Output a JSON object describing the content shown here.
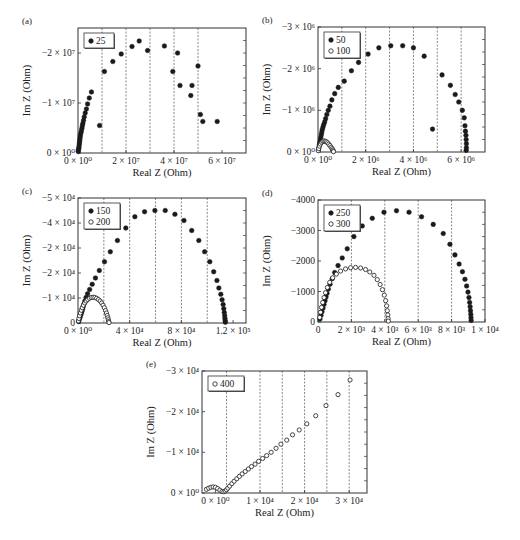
{
  "figure": {
    "background": "#ffffff",
    "marker_color": "#1a1a1a",
    "grid_color": "#555555"
  },
  "chart_data": [
    {
      "id": "a",
      "type": "scatter",
      "panel_label": "(a)",
      "xlabel": "Real Z (Ohm)",
      "ylabel": "Im Z (Ohm)",
      "xlim": [
        0,
        70000000
      ],
      "ylim": [
        0,
        -25000000
      ],
      "xticks": [
        {
          "v": 0,
          "label": "0 × 10⁰"
        },
        {
          "v": 20000000,
          "label": "2 × 10⁷"
        },
        {
          "v": 40000000,
          "label": "4 × 10⁷"
        },
        {
          "v": 60000000,
          "label": "6 × 10⁷"
        }
      ],
      "yticks": [
        {
          "v": 0,
          "label": "0 × 10⁰"
        },
        {
          "v": -10000000,
          "label": "−1 × 10⁷"
        },
        {
          "v": -20000000,
          "label": "−2 × 10⁷"
        }
      ],
      "vgrid": [
        10000000,
        20000000,
        30000000,
        40000000,
        50000000
      ],
      "legend": [
        {
          "label": "25",
          "marker": "filled"
        }
      ],
      "series": [
        {
          "name": "25",
          "marker": "filled",
          "x": [
            100000,
            200000,
            300000,
            400000,
            500000,
            600000,
            700000,
            800000,
            900000,
            1000000,
            1200000,
            1400000,
            1600000,
            1800000,
            2000000,
            2300000,
            2600000,
            3000000,
            3500000,
            4000000,
            4700000,
            5600000,
            9000000,
            11000000,
            14500000,
            18000000,
            22500000,
            25500000,
            29000000,
            36000000,
            39500000,
            41500000,
            42500000,
            47000000,
            47500000,
            50000000,
            51000000,
            52000000,
            58000000
          ],
          "y": [
            -300000,
            -600000,
            -900000,
            -1200000,
            -1600000,
            -2000000,
            -2400000,
            -2800000,
            -3200000,
            -3600000,
            -4000000,
            -4400000,
            -4900000,
            -5400000,
            -5900000,
            -6500000,
            -7200000,
            -8000000,
            -8800000,
            -9800000,
            -11000000,
            -12200000,
            -5500000,
            -16300000,
            -18300000,
            -19800000,
            -21300000,
            -22400000,
            -20500000,
            -21400000,
            -16300000,
            -20000000,
            -13500000,
            -11500000,
            -13500000,
            -17400000,
            -7700000,
            -6300000,
            -6300000
          ]
        }
      ]
    },
    {
      "id": "b",
      "type": "scatter",
      "panel_label": "(b)",
      "xlabel": "Real Z (Ohm)",
      "ylabel": "Im Z (Ohm)",
      "xlim": [
        0,
        7000000
      ],
      "ylim": [
        0,
        -3000000
      ],
      "xticks": [
        {
          "v": 0,
          "label": "0 × 10⁰"
        },
        {
          "v": 2000000,
          "label": "2 × 10⁶"
        },
        {
          "v": 4000000,
          "label": "4 × 10⁶"
        },
        {
          "v": 6000000,
          "label": "6 × 10⁶"
        }
      ],
      "yticks": [
        {
          "v": 0,
          "label": "0 × 10⁰"
        },
        {
          "v": -1000000,
          "label": "−1 × 10⁶"
        },
        {
          "v": -2000000,
          "label": "−2 × 10⁶"
        },
        {
          "v": -3000000,
          "label": "−3 × 10⁶"
        }
      ],
      "vgrid": [
        1000000,
        2000000,
        3000000,
        4000000,
        5000000,
        6000000
      ],
      "legend": [
        {
          "label": "50",
          "marker": "filled"
        },
        {
          "label": "100",
          "marker": "open"
        }
      ],
      "series": [
        {
          "name": "50",
          "marker": "filled",
          "x": [
            20000,
            40000,
            60000,
            80000,
            100000,
            120000,
            140000,
            160000,
            180000,
            210000,
            240000,
            280000,
            320000,
            370000,
            430000,
            500000,
            580000,
            700000,
            850000,
            1100000,
            1400000,
            1700000,
            2100000,
            2550000,
            3050000,
            3550000,
            4000000,
            4450000,
            4800000,
            5200000,
            5550000,
            5750000,
            5900000,
            6050000,
            6130000,
            6160000,
            6180000,
            6200000,
            6210000,
            6220000,
            6220000,
            6210000
          ],
          "y": [
            -60000,
            -120000,
            -180000,
            -240000,
            -300000,
            -360000,
            -420000,
            -480000,
            -540000,
            -600000,
            -660000,
            -720000,
            -800000,
            -900000,
            -1000000,
            -1100000,
            -1250000,
            -1400000,
            -1550000,
            -1700000,
            -1950000,
            -2150000,
            -2350000,
            -2500000,
            -2550000,
            -2550000,
            -2500000,
            -2300000,
            -550000,
            -1850000,
            -1600000,
            -1380000,
            -1200000,
            -1000000,
            -820000,
            -630000,
            -500000,
            -400000,
            -300000,
            -200000,
            -100000,
            -40000
          ]
        },
        {
          "name": "100",
          "marker": "open",
          "x": [
            10000,
            30000,
            60000,
            100000,
            150000,
            200000,
            250000,
            300000,
            350000,
            400000,
            450000,
            500000,
            550000,
            590000,
            620000,
            640000,
            650000
          ],
          "y": [
            -30000,
            -80000,
            -140000,
            -190000,
            -230000,
            -255000,
            -265000,
            -260000,
            -245000,
            -220000,
            -190000,
            -155000,
            -115000,
            -80000,
            -50000,
            -25000,
            -8000
          ]
        }
      ]
    },
    {
      "id": "c",
      "type": "scatter",
      "panel_label": "(c)",
      "xlabel": "Real Z (Ohm)",
      "ylabel": "Im Z (Ohm)",
      "xlim": [
        0,
        130000
      ],
      "ylim": [
        0,
        -50000
      ],
      "xticks": [
        {
          "v": 0,
          "label": "0 × 10⁰"
        },
        {
          "v": 40000,
          "label": "4 × 10⁴"
        },
        {
          "v": 80000,
          "label": "8 × 10⁴"
        },
        {
          "v": 120000,
          "label": "1.2 × 10⁵"
        }
      ],
      "yticks": [
        {
          "v": 0,
          "label": "0"
        },
        {
          "v": -10000,
          "label": "−1 × 10⁴"
        },
        {
          "v": -20000,
          "label": "−2 × 10⁴"
        },
        {
          "v": -30000,
          "label": "−2 × 10⁴"
        },
        {
          "v": -40000,
          "label": "−4 × 10⁴"
        },
        {
          "v": -50000,
          "label": "−5 × 10⁴"
        }
      ],
      "vgrid": [
        20000,
        40000,
        60000,
        80000,
        100000
      ],
      "legend": [
        {
          "label": "150",
          "marker": "filled"
        },
        {
          "label": "200",
          "marker": "open"
        }
      ],
      "series": [
        {
          "name": "150",
          "marker": "filled",
          "x": [
            500,
            1000,
            1500,
            2000,
            2500,
            3000,
            3500,
            4000,
            4600,
            5300,
            6200,
            7400,
            9000,
            11000,
            13500,
            16500,
            20500,
            25000,
            30500,
            37000,
            44000,
            51500,
            59500,
            67500,
            75000,
            82000,
            88000,
            93500,
            98000,
            102000,
            105000,
            107500,
            109000,
            110500,
            111500,
            112300,
            112800,
            113200,
            113500,
            113700,
            113900,
            114000
          ],
          "y": [
            -600,
            -1400,
            -2200,
            -3000,
            -3800,
            -4600,
            -5500,
            -6500,
            -7600,
            -8800,
            -10200,
            -11700,
            -13400,
            -15500,
            -18000,
            -21000,
            -24500,
            -28500,
            -33000,
            -38000,
            -42500,
            -44500,
            -45000,
            -45000,
            -43500,
            -41000,
            -37000,
            -33000,
            -28500,
            -24500,
            -20500,
            -17000,
            -14000,
            -11500,
            -9300,
            -7400,
            -5700,
            -4200,
            -2900,
            -1800,
            -900,
            -300
          ]
        },
        {
          "name": "200",
          "marker": "open",
          "x": [
            300,
            700,
            1200,
            1800,
            2500,
            3300,
            4200,
            5200,
            6300,
            7500,
            8800,
            10200,
            11600,
            13000,
            14400,
            15800,
            17100,
            18300,
            19400,
            20400,
            21300,
            22000,
            22600,
            23100,
            23500,
            23800,
            24000
          ],
          "y": [
            -800,
            -1800,
            -2900,
            -4000,
            -5100,
            -6100,
            -7100,
            -8000,
            -8800,
            -9400,
            -9900,
            -10200,
            -10300,
            -10200,
            -9900,
            -9400,
            -8800,
            -8000,
            -7100,
            -6100,
            -5000,
            -4000,
            -3000,
            -2100,
            -1300,
            -600,
            -150
          ]
        }
      ]
    },
    {
      "id": "d",
      "type": "scatter",
      "panel_label": "(d)",
      "xlabel": "Real Z (Ohm)",
      "ylabel": "Im Z (Ohm)",
      "xlim": [
        0,
        10000
      ],
      "ylim": [
        0,
        -4000
      ],
      "xticks": [
        {
          "v": 0,
          "label": "0"
        },
        {
          "v": 2000,
          "label": "2 × 10³"
        },
        {
          "v": 4000,
          "label": "4 × 10³"
        },
        {
          "v": 6000,
          "label": "6 × 10³"
        },
        {
          "v": 8000,
          "label": "8 × 10³"
        },
        {
          "v": 10000,
          "label": "1 × 10⁴"
        }
      ],
      "yticks": [
        {
          "v": 0,
          "label": "0"
        },
        {
          "v": -1000,
          "label": "−1000"
        },
        {
          "v": -2000,
          "label": "−2000"
        },
        {
          "v": -3000,
          "label": "−3000"
        },
        {
          "v": -4000,
          "label": "−4000"
        }
      ],
      "vgrid": [
        2000,
        4000,
        6000,
        8000
      ],
      "legend": [
        {
          "label": "250",
          "marker": "filled"
        },
        {
          "label": "300",
          "marker": "open"
        }
      ],
      "series": [
        {
          "name": "250",
          "marker": "filled",
          "x": [
            120,
            180,
            240,
            300,
            360,
            420,
            480,
            540,
            620,
            720,
            850,
            1000,
            1200,
            1450,
            1750,
            2150,
            2650,
            3250,
            3950,
            4700,
            5450,
            6200,
            6900,
            7500,
            7900,
            8200,
            8450,
            8650,
            8800,
            8900,
            8980,
            9040,
            9080,
            9110,
            9130,
            9150,
            9160,
            9170
          ],
          "y": [
            -100,
            -220,
            -340,
            -460,
            -580,
            -700,
            -820,
            -940,
            -1080,
            -1240,
            -1420,
            -1620,
            -1850,
            -2100,
            -2400,
            -2800,
            -3150,
            -3400,
            -3600,
            -3650,
            -3600,
            -3450,
            -3200,
            -2900,
            -2550,
            -2200,
            -1900,
            -1650,
            -1400,
            -1180,
            -980,
            -800,
            -640,
            -500,
            -370,
            -250,
            -140,
            -50
          ]
        },
        {
          "name": "300",
          "marker": "open",
          "x": [
            100,
            150,
            210,
            280,
            360,
            450,
            560,
            700,
            880,
            1100,
            1350,
            1650,
            1950,
            2250,
            2550,
            2850,
            3100,
            3350,
            3550,
            3720,
            3860,
            3970,
            4050,
            4110,
            4150,
            4180,
            4200,
            4210
          ],
          "y": [
            -150,
            -320,
            -480,
            -640,
            -800,
            -960,
            -1130,
            -1300,
            -1450,
            -1570,
            -1670,
            -1740,
            -1780,
            -1790,
            -1770,
            -1720,
            -1640,
            -1530,
            -1390,
            -1230,
            -1060,
            -880,
            -700,
            -530,
            -370,
            -230,
            -110,
            -30
          ]
        }
      ]
    },
    {
      "id": "e",
      "type": "scatter",
      "panel_label": "(e)",
      "xlabel": "Real Z (Ohm)",
      "ylabel": "Im Z (Ohm)",
      "xlim": [
        -3000,
        34000
      ],
      "ylim": [
        0,
        -30000
      ],
      "xticks": [
        {
          "v": 0,
          "label": "0 × 10⁰"
        },
        {
          "v": 10000,
          "label": "1 × 10⁴"
        },
        {
          "v": 20000,
          "label": "2 × 10⁴"
        },
        {
          "v": 30000,
          "label": "3 × 10⁴"
        }
      ],
      "yticks": [
        {
          "v": 0,
          "label": "0 × 10⁰"
        },
        {
          "v": -10000,
          "label": "−1 × 10⁴"
        },
        {
          "v": -20000,
          "label": "−2 × 10⁴"
        },
        {
          "v": -30000,
          "label": "−3 × 10⁴"
        }
      ],
      "vgrid": [
        2500,
        10000,
        15000,
        20000,
        25000,
        30000
      ],
      "legend": [
        {
          "label": "400",
          "marker": "open"
        }
      ],
      "series": [
        {
          "name": "400",
          "marker": "open",
          "x": [
            -2000,
            -1500,
            -1000,
            -500,
            0,
            500,
            1000,
            1500,
            1900,
            2200,
            2500,
            2800,
            3200,
            3700,
            4200,
            4800,
            5400,
            6000,
            6700,
            7400,
            8100,
            8900,
            9700,
            10600,
            11500,
            12500,
            13600,
            14700,
            16000,
            17300,
            18800,
            20500,
            22500,
            24800,
            27500,
            30200
          ],
          "y": [
            -900,
            -1200,
            -1400,
            -1500,
            -1400,
            -1100,
            -700,
            -400,
            -300,
            -500,
            -800,
            -1200,
            -1700,
            -2300,
            -2900,
            -3500,
            -4100,
            -4700,
            -5300,
            -5900,
            -6500,
            -7100,
            -7800,
            -8500,
            -9200,
            -10000,
            -11000,
            -12000,
            -13000,
            -14300,
            -15500,
            -17000,
            -19000,
            -21500,
            -24200,
            -27800
          ]
        }
      ]
    }
  ],
  "layout_boxes": {
    "a": {
      "x0": 78,
      "y0": 28,
      "x1": 246,
      "y1": 153
    },
    "b": {
      "x0": 318,
      "y0": 27,
      "x1": 485,
      "y1": 152
    },
    "c": {
      "x0": 78,
      "y0": 198,
      "x1": 246,
      "y1": 323
    },
    "d": {
      "x0": 318,
      "y0": 200,
      "x1": 485,
      "y1": 322
    },
    "e": {
      "x0": 202,
      "y0": 371,
      "x1": 367,
      "y1": 493
    }
  }
}
